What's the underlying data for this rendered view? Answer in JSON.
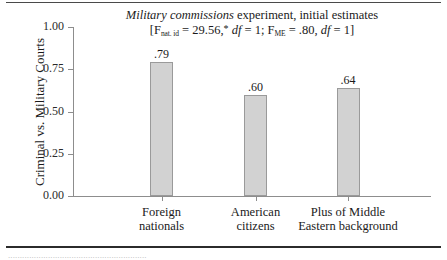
{
  "figure": {
    "footnote_clipped": "...........................................................",
    "title_line1_italic": "Military commissions",
    "title_line1_rest": " experiment, initial estimates",
    "stat_open": "[F",
    "stat_sub1": "nat. id",
    "stat_eq1": " = 29.56,",
    "stat_star": "*",
    "stat_df1_italic": "df",
    "stat_df1_val": " = 1; F",
    "stat_sub2": "ME",
    "stat_eq2": " = .80, ",
    "stat_df2_italic": "df",
    "stat_df2_val": " = 1]"
  },
  "chart_data": {
    "type": "bar",
    "title": "Military commissions experiment, initial estimates",
    "subtitle": "[F nat. id = 29.56,* df = 1; F ME = .80, df = 1]",
    "categories": [
      "Foreign nationals",
      "American citizens",
      "Plus of Middle Eastern background"
    ],
    "category_lines": [
      [
        "Foreign",
        "nationals"
      ],
      [
        "American",
        "citizens"
      ],
      [
        "Plus of Middle",
        "Eastern background"
      ]
    ],
    "values": [
      0.79,
      0.6,
      0.64
    ],
    "value_labels": [
      ".79",
      ".60",
      ".64"
    ],
    "xlabel": "",
    "ylabel": "Criminal vs. Military Courts",
    "ylim": [
      0.0,
      1.0
    ],
    "yticks": [
      1.0,
      0.75,
      0.5,
      0.25,
      0.0
    ],
    "ytick_labels": [
      "1.00",
      "0.75",
      "0.50",
      "0.25",
      "0.00"
    ],
    "grid": false,
    "legend": null,
    "bar_color": "#d2d2d2",
    "bar_edge_color": "#9a9a9a",
    "axis_color": "#8d8d8d"
  }
}
